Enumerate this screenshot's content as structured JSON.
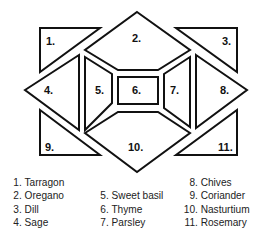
{
  "diagram": {
    "beds": [
      {
        "id": 1,
        "label": "1.",
        "points": "40,28 100,28 40,72",
        "lx": 46,
        "ly": 45
      },
      {
        "id": 2,
        "label": "2.",
        "points": "137,12 190,50 158,70 118,70 85,50",
        "lx": 132,
        "ly": 42
      },
      {
        "id": 3,
        "label": "3.",
        "points": "176,28 237,28 237,72",
        "lx": 222,
        "ly": 45
      },
      {
        "id": 4,
        "label": "4.",
        "points": "25,90 79,55 79,130",
        "lx": 44,
        "ly": 94
      },
      {
        "id": 5,
        "label": "5.",
        "points": "85,57 112,74 112,103 85,130",
        "lx": 95,
        "ly": 94
      },
      {
        "id": 6,
        "label": "6.",
        "points": "118,77 158,77 158,104 118,104",
        "lx": 132,
        "ly": 94
      },
      {
        "id": 7,
        "label": "7.",
        "points": "164,74 190,57 190,127 164,108",
        "lx": 170,
        "ly": 94
      },
      {
        "id": 8,
        "label": "8.",
        "points": "196,55 247,90 196,128",
        "lx": 220,
        "ly": 94
      },
      {
        "id": 9,
        "label": "9.",
        "points": "40,110 100,155 40,155",
        "lx": 45,
        "ly": 151
      },
      {
        "id": 10,
        "label": "10.",
        "points": "85,133 118,112 158,112 190,133 137,172",
        "lx": 128,
        "ly": 151
      },
      {
        "id": 11,
        "label": "11.",
        "points": "237,110 237,155 176,155",
        "lx": 218,
        "ly": 151
      }
    ]
  },
  "legend": {
    "columns": [
      [
        {
          "num": "1.",
          "name": "Tarragon"
        },
        {
          "num": "2.",
          "name": "Oregano"
        },
        {
          "num": "3.",
          "name": "Dill"
        },
        {
          "num": "4.",
          "name": "Sage"
        }
      ],
      [
        {
          "num": "",
          "name": ""
        },
        {
          "num": "5.",
          "name": "Sweet basil"
        },
        {
          "num": "6.",
          "name": "Thyme"
        },
        {
          "num": "7.",
          "name": "Parsley"
        }
      ],
      [
        {
          "num": "8.",
          "name": "Chives"
        },
        {
          "num": "9.",
          "name": "Coriander"
        },
        {
          "num": "10.",
          "name": "Nasturtium"
        },
        {
          "num": "11.",
          "name": "Rosemary"
        }
      ]
    ]
  }
}
